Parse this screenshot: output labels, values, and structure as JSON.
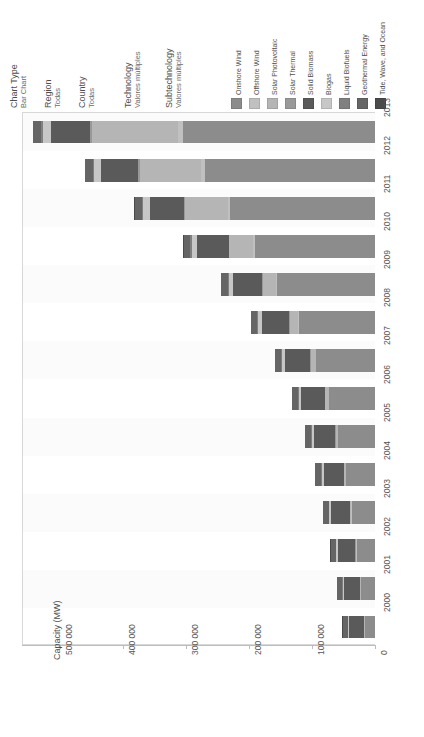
{
  "filters": [
    {
      "name": "chart-type",
      "title": "Chart Type",
      "value": "Bar Chart",
      "x": 28
    },
    {
      "name": "region",
      "title": "Region",
      "value": "Todas",
      "x": 62
    },
    {
      "name": "country",
      "title": "Country",
      "value": "Todas",
      "x": 96
    },
    {
      "name": "technology",
      "title": "Technology",
      "value": "Valores múltiples",
      "x": 142
    },
    {
      "name": "subtechnology",
      "title": "Subtechnology",
      "value": "Valores múltiples",
      "x": 183
    }
  ],
  "legend": {
    "position": "top-right",
    "items": [
      {
        "label": "Onshore Wind",
        "color": "#8c8c8c",
        "x": 231
      },
      {
        "label": "Offshore Wind",
        "color": "#c0c0c0",
        "x": 249
      },
      {
        "label": "Solar Photovoltaic",
        "color": "#b5b5b5",
        "x": 267
      },
      {
        "label": "Solar Thermal",
        "color": "#999999",
        "x": 285
      },
      {
        "label": "Solid Biomass",
        "color": "#5a5a5a",
        "x": 303
      },
      {
        "label": "Biogas",
        "color": "#c7c7c7",
        "x": 321
      },
      {
        "label": "Liquid Biofuels",
        "color": "#808080",
        "x": 339
      },
      {
        "label": "Geothermal Energy",
        "color": "#656565",
        "x": 357
      },
      {
        "label": "Tide, Wave, and Ocean",
        "color": "#4a4a4a",
        "x": 375
      }
    ]
  },
  "chart_data": {
    "type": "bar",
    "orientation": "horizontal-rotated",
    "title": "",
    "xlabel": "",
    "ylabel": "Capacity (MW)",
    "ylim": [
      0,
      560000
    ],
    "grid": false,
    "tick_labels": [
      "500 000",
      "400 000",
      "300 000",
      "200 000",
      "100 000",
      "0"
    ],
    "tick_values": [
      500000,
      400000,
      300000,
      200000,
      100000,
      0
    ],
    "categories": [
      "2013",
      "2012",
      "2011",
      "2010",
      "2009",
      "2008",
      "2007",
      "2006",
      "2005",
      "2004",
      "2003",
      "2002",
      "2001",
      "2000"
    ],
    "series": [
      {
        "name": "Onshore Wind",
        "color": "#8c8c8c",
        "values": [
          305000,
          270000,
          230000,
          190000,
          155000,
          120000,
          93000,
          73000,
          58000,
          46000,
          37000,
          29000,
          22000,
          16000
        ]
      },
      {
        "name": "Offshore Wind",
        "color": "#c0c0c0",
        "values": [
          7000,
          5500,
          4000,
          3000,
          2100,
          1500,
          1100,
          800,
          700,
          600,
          500,
          400,
          300,
          200
        ]
      },
      {
        "name": "Solar Photovoltaic",
        "color": "#b5b5b5",
        "values": [
          137000,
          98000,
          68000,
          38000,
          21000,
          14000,
          8000,
          5500,
          4000,
          2800,
          1800,
          1300,
          1000,
          800
        ]
      },
      {
        "name": "Solar Thermal",
        "color": "#999999",
        "values": [
          3500,
          2500,
          1700,
          1200,
          700,
          500,
          450,
          420,
          400,
          390,
          380,
          370,
          360,
          350
        ]
      },
      {
        "name": "Solid Biomass",
        "color": "#5a5a5a",
        "values": [
          62000,
          58000,
          54000,
          50000,
          46000,
          43000,
          40000,
          37000,
          34000,
          32000,
          30000,
          28000,
          26000,
          24000
        ]
      },
      {
        "name": "Biogas",
        "color": "#c7c7c7",
        "values": [
          13000,
          11500,
          10000,
          8500,
          7000,
          6000,
          5000,
          4200,
          3500,
          3000,
          2600,
          2200,
          1900,
          1600
        ]
      },
      {
        "name": "Liquid Biofuels",
        "color": "#808080",
        "values": [
          3000,
          2800,
          2600,
          2300,
          2000,
          1700,
          1400,
          1200,
          1000,
          900,
          800,
          700,
          600,
          500
        ]
      },
      {
        "name": "Geothermal Energy",
        "color": "#656565",
        "values": [
          11500,
          11200,
          10900,
          10600,
          10400,
          10200,
          10000,
          9700,
          9400,
          9100,
          8800,
          8500,
          8200,
          8000
        ]
      },
      {
        "name": "Tide, Wave, and Ocean",
        "color": "#4a4a4a",
        "values": [
          520,
          520,
          520,
          510,
          510,
          500,
          500,
          500,
          490,
          490,
          490,
          480,
          480,
          480
        ]
      }
    ]
  }
}
